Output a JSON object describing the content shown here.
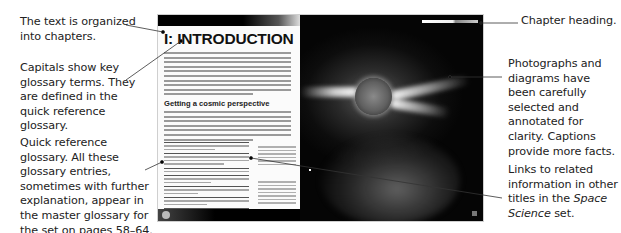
{
  "annotations": {
    "chapters": "The text is organized into chapters.",
    "capitals": "Capitals show key glossary terms. They are defined in the quick reference glossary.",
    "glossary": "Quick reference glossary. All these glossary entries, sometimes with further explanation, appear in the master glossary for the set on pages 58–64.",
    "chapter_heading": "Chapter heading.",
    "photographs": "Photographs and diagrams have been carefully selected and annotated for clarity. Captions provide more facts.",
    "links_prefix": "Links to related information in other titles in the ",
    "links_series": "Space Science",
    "links_suffix": " set."
  },
  "spread": {
    "left_page": {
      "chapter_title": "I: INTRODUCTION",
      "subheading": "Getting a cosmic perspective"
    },
    "right_page": {
      "image_description": "Space photograph of the Sun with coronal streamers and star field"
    }
  },
  "colors": {
    "page_background": "#ffffff",
    "annotation_text": "#222222",
    "left_page": "#fbfbfb",
    "right_page_dark": "#050505"
  }
}
